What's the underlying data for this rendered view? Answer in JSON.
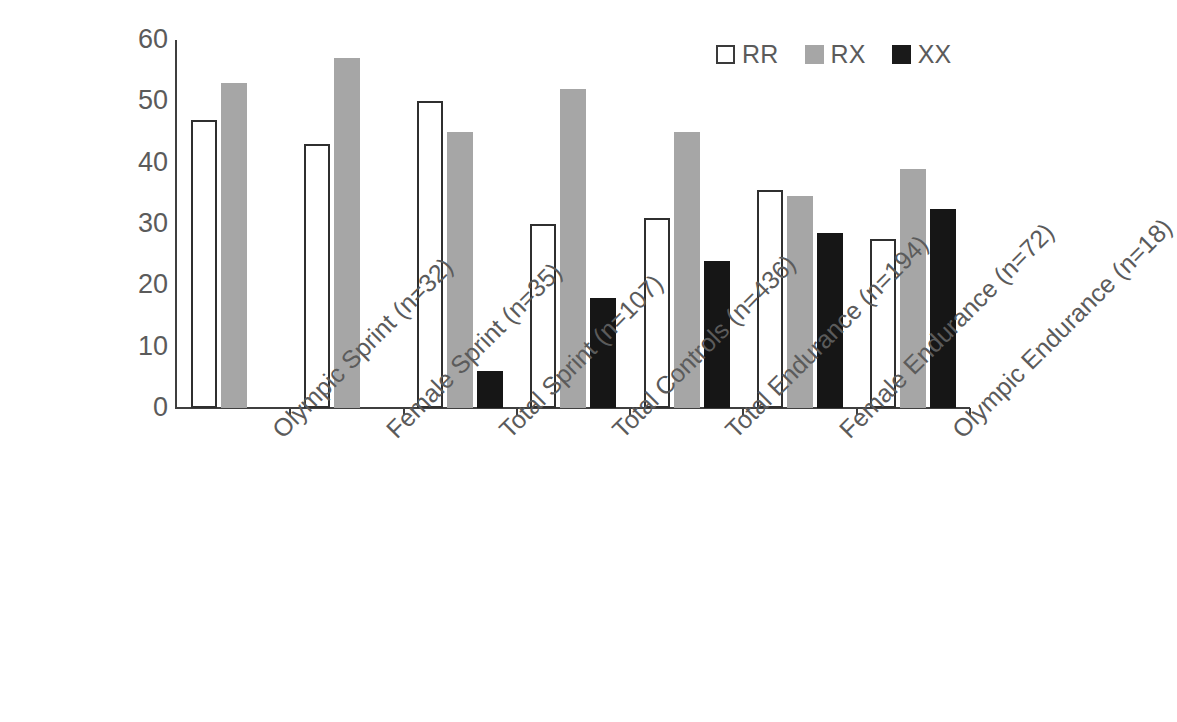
{
  "chart_data": {
    "type": "bar",
    "title": "",
    "subtitle": "",
    "xlabel": "",
    "ylabel": "",
    "ylim": [
      0,
      60
    ],
    "ytick_labels": [
      "0",
      "10",
      "20",
      "30",
      "40",
      "50",
      "60"
    ],
    "yticks": [
      0,
      10,
      20,
      30,
      40,
      50,
      60
    ],
    "grid": false,
    "legend_position": "top-right",
    "categories": [
      "Olympic Sprint (n=32)",
      "Female Sprint (n=35)",
      "Total Sprint (n=107)",
      "Total Controls (n=436)",
      "Total Endurance (n=194)",
      "Female Endurance (n=72)",
      "Olympic Endurance (n=18)"
    ],
    "series": [
      {
        "name": "RR",
        "color": "#ffffff",
        "values": [
          47,
          43,
          50,
          30,
          31,
          35.5,
          27.5
        ]
      },
      {
        "name": "RX",
        "color": "#a6a6a6",
        "values": [
          53,
          57,
          45,
          52,
          45,
          34.5,
          39
        ]
      },
      {
        "name": "XX",
        "color": "#161616",
        "values": [
          0,
          0,
          6,
          18,
          24,
          28.5,
          32.5
        ]
      }
    ]
  },
  "legend": {
    "entries": [
      {
        "label": "RR",
        "swatch": "white-outlined-square"
      },
      {
        "label": "RX",
        "swatch": "gray-square"
      },
      {
        "label": "XX",
        "swatch": "black-square"
      }
    ]
  },
  "colors": {
    "axis": "#3f3f3f",
    "text": "#5b5b5b",
    "rr_fill": "#ffffff",
    "rr_stroke": "#2f2f2f",
    "rx_fill": "#a6a6a6",
    "xx_fill": "#161616",
    "background": "#ffffff"
  }
}
